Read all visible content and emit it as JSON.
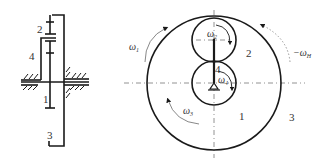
{
  "figure": {
    "type": "planetary gear train schematic",
    "left_view": {
      "labels": {
        "gear_2": "2",
        "carrier_4": "4",
        "gear_1": "1",
        "gear_3": "3"
      }
    },
    "right_view": {
      "labels": {
        "gear_1": "1",
        "gear_2": "2",
        "gear_3": "3",
        "carrier_4": "4",
        "omega_1": "ω",
        "omega_1_sub": "1",
        "omega_2": "ω",
        "omega_2_sub": "2",
        "omega_3": "ω",
        "omega_3_sub": "3",
        "omega_4": "ω",
        "omega_4_sub": "4",
        "omega_H": "−ω",
        "omega_H_sub": "H"
      }
    },
    "colors": {
      "line": "#1a1a1a",
      "centerline": "#777777",
      "arrow": "#888888",
      "text": "#333333"
    }
  }
}
